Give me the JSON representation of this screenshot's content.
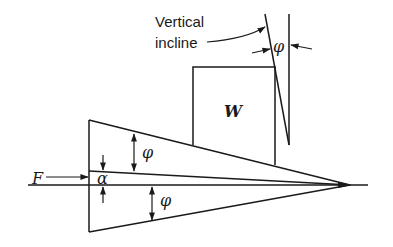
{
  "diagram": {
    "type": "mechanics-wedge-friction",
    "labels": {
      "incline_label_line1": "Vertical",
      "incline_label_line2": "incline",
      "weight": "W",
      "force": "F",
      "alpha": "α",
      "phi_top": "φ",
      "phi_bottom": "φ",
      "phi_incline": "φ"
    },
    "elements": [
      {
        "name": "wedge",
        "description": "Triangular wedge with tip pointing right"
      },
      {
        "name": "block",
        "label": "W",
        "description": "Rectangular block resting on upper face of wedge"
      },
      {
        "name": "vertical-incline",
        "description": "Inclined wall at angle φ from vertical against block"
      },
      {
        "name": "force-arrow",
        "label": "F",
        "description": "Horizontal force pushing wedge"
      },
      {
        "name": "alpha-angle",
        "label": "α",
        "description": "Wedge half-angle dimension at base"
      },
      {
        "name": "phi-angles",
        "label": "φ",
        "description": "Friction angles marked on wedge faces and incline"
      }
    ],
    "colors": {
      "ink": "#1a1a1a",
      "background": "#ffffff"
    }
  }
}
